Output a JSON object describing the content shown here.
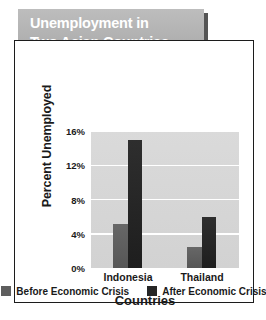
{
  "banner": {
    "title": "Unemployment in\nTwo Asian Countries",
    "background_color": "#b4b4b4",
    "text_color": "#ffffff"
  },
  "chart_data": {
    "type": "bar",
    "title": "Unemployment in Two Asian Countries",
    "categories": [
      "Indonesia",
      "Thailand"
    ],
    "series": [
      {
        "name": "Before Economic Crisis",
        "values": [
          5.1,
          2.4
        ],
        "color": "#5e5e5e"
      },
      {
        "name": "After Economic Crisis",
        "values": [
          15.0,
          6.0
        ],
        "color": "#262626"
      }
    ],
    "xlabel": "Countries",
    "ylabel": "Percent Unemployed",
    "ylim": [
      0,
      16
    ],
    "yticks": [
      0,
      4,
      8,
      12,
      16
    ],
    "ytick_labels": [
      "0%",
      "4%",
      "8%",
      "12%",
      "16%"
    ],
    "grid": true,
    "grid_color": "#ffffff",
    "plot_background": "#d6d6d6",
    "legend_position": "bottom"
  },
  "legend": {
    "items": [
      {
        "label": "Before Economic Crisis",
        "color": "#5e5e5e"
      },
      {
        "label": "After Economic Crisis",
        "color": "#262626"
      }
    ]
  }
}
